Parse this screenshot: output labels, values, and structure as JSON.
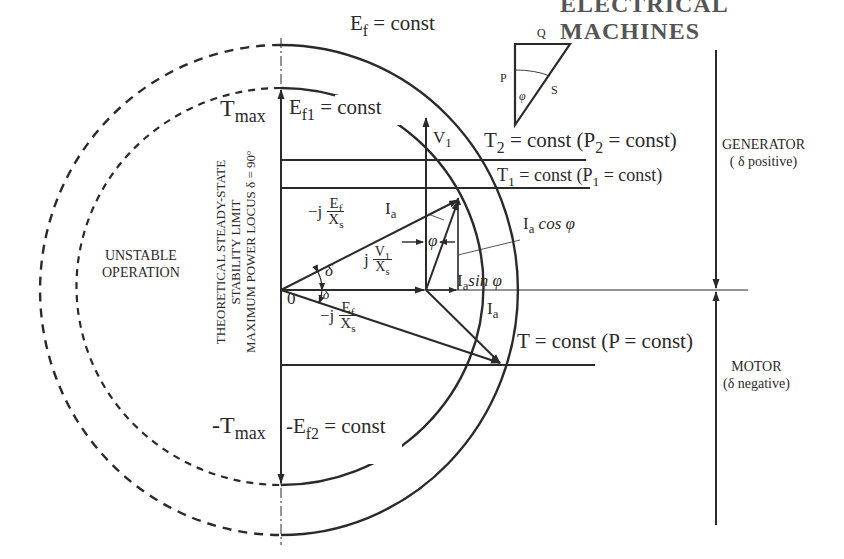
{
  "header": {
    "clipped_title": "ELECTRICAL MACHINES"
  },
  "diagram": {
    "circles": {
      "outer_label": "E",
      "outer_sub": "f",
      "outer_rest": " = const",
      "inner_label": "E",
      "inner_sub": "f1",
      "inner_rest": " = const",
      "neg_label": "-E",
      "neg_sub": "f2",
      "neg_rest": " = const"
    },
    "axis": {
      "tmax_main": "T",
      "tmax_sub": "max",
      "neg_tmax_main": "-T",
      "neg_tmax_sub": "max",
      "origin": "0"
    },
    "stability_text": {
      "line1": "THEORETICAL STEADY-STATE",
      "line2": "STABILITY LIMIT",
      "line3": "MAXIMUM POWER LOCUS δ = 90º"
    },
    "unstable": {
      "line1": "UNSTABLE",
      "line2": "OPERATION"
    },
    "power_triangle": {
      "q": "Q",
      "p": "P",
      "s": "S",
      "phi": "φ"
    },
    "torque_lines": {
      "t2_main": "T",
      "t2_sub": "2",
      "t2_mid": " = const (P",
      "t2_sub2": "2",
      "t2_end": " = const)",
      "t1_main": "T",
      "t1_sub": "1",
      "t1_mid": " = const (P",
      "t1_sub2": "1",
      "t1_end": " = const)",
      "t_text": "T = const (P = const)"
    },
    "vectors": {
      "v1_main": "V",
      "v1_sub": "1",
      "ia_main": "I",
      "ia_sub": "a",
      "ia_cos_rest": " cos φ",
      "ia_sin_rest": "sin φ",
      "phi": "φ",
      "delta": "δ",
      "neg_delta": "-δ",
      "neg_j": "−j",
      "j": "j",
      "ef_num_main": "E",
      "ef_num_sub": "f",
      "xs_main": "X",
      "xs_sub": "s",
      "v1_num_main": "V",
      "v1_num_sub": "1"
    },
    "regions": {
      "generator": "GENERATOR",
      "generator_note": "( δ positive)",
      "motor": "MOTOR",
      "motor_note": "(δ  negative)"
    }
  }
}
